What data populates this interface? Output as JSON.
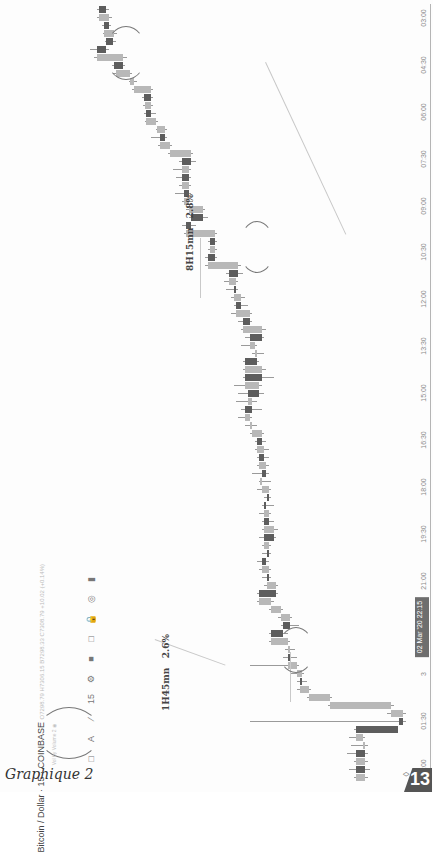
{
  "page": {
    "caption": "Graphique 2",
    "page_number": "13"
  },
  "chart_header": {
    "symbol_title": "Bitcoin / Dollar · 15 · COINBASE",
    "ohlc": "O7298.79 H7306.15 B7298.33 C7308.79 +10.02 (+0.14%)",
    "indicator": "Vol by Volume 2",
    "eye_icon": "◉"
  },
  "toolbar": {
    "items": [
      {
        "name": "rectangle-tool",
        "glyph": "□"
      },
      {
        "name": "text-tool",
        "glyph": "A"
      },
      {
        "name": "trendline-tool",
        "glyph": "∕"
      },
      {
        "name": "interval-15",
        "glyph": "15"
      },
      {
        "name": "settings-gear",
        "glyph": "⚙"
      },
      {
        "name": "fill-color",
        "glyph": "■"
      },
      {
        "name": "shape-select",
        "glyph": "□"
      },
      {
        "name": "lock",
        "glyph": "🔒"
      },
      {
        "name": "visibility",
        "glyph": "◎"
      },
      {
        "name": "more",
        "glyph": "▮"
      }
    ]
  },
  "annotations": [
    {
      "label": "8H15mn",
      "pct": "2.8%"
    },
    {
      "label": "1H45mn",
      "pct": "2.6%"
    }
  ],
  "chart_data": {
    "type": "candlestick",
    "title": "Bitcoin / Dollar · 15 · COINBASE",
    "orientation": "rotated 90° clockwise (time runs bottom→top, price increases leftward)",
    "xlabel": "Time (15-min candles)",
    "ylabel": "Price (USD)",
    "x_ticks": [
      "03:00",
      "04:30",
      "06:00",
      "07:30",
      "09:00",
      "10:30",
      "12:00",
      "13:30",
      "15:00",
      "16:30",
      "18:00",
      "19:30",
      "21:00",
      "02 Mar '20 22:15",
      "3",
      "01:30",
      "03:00"
    ],
    "highlighted_tick": "02 Mar '20 22:15",
    "annotations": [
      {
        "text": "8H15mn 2.8%",
        "from": "04:00",
        "to": "12:15"
      },
      {
        "text": "1H45mn 2.6%",
        "from": "22:45",
        "to": "01:00"
      }
    ],
    "candles": [
      {
        "x": 2,
        "o": 58,
        "c": 52,
        "h": 60,
        "l": 50
      },
      {
        "x": 10,
        "o": 52,
        "c": 60,
        "h": 63,
        "l": 50
      },
      {
        "x": 18,
        "o": 60,
        "c": 56,
        "h": 62,
        "l": 54
      },
      {
        "x": 26,
        "o": 56,
        "c": 65,
        "h": 67,
        "l": 55
      },
      {
        "x": 34,
        "o": 64,
        "c": 58,
        "h": 66,
        "l": 57
      },
      {
        "x": 42,
        "o": 58,
        "c": 50,
        "h": 60,
        "l": 44
      },
      {
        "x": 50,
        "o": 50,
        "c": 72,
        "h": 76,
        "l": 48
      },
      {
        "x": 58,
        "o": 72,
        "c": 65,
        "h": 74,
        "l": 63
      },
      {
        "x": 66,
        "o": 66,
        "c": 78,
        "h": 80,
        "l": 64
      },
      {
        "x": 74,
        "o": 78,
        "c": 82,
        "h": 84,
        "l": 77
      },
      {
        "x": 82,
        "o": 82,
        "c": 96,
        "h": 98,
        "l": 80
      },
      {
        "x": 90,
        "o": 96,
        "c": 90,
        "h": 98,
        "l": 88
      },
      {
        "x": 98,
        "o": 91,
        "c": 96,
        "h": 98,
        "l": 89
      },
      {
        "x": 106,
        "o": 96,
        "c": 92,
        "h": 100,
        "l": 90
      },
      {
        "x": 114,
        "o": 92,
        "c": 100,
        "h": 102,
        "l": 91
      },
      {
        "x": 122,
        "o": 101,
        "c": 108,
        "h": 110,
        "l": 100
      },
      {
        "x": 130,
        "o": 108,
        "c": 104,
        "h": 110,
        "l": 96
      },
      {
        "x": 138,
        "o": 104,
        "c": 112,
        "h": 114,
        "l": 102
      },
      {
        "x": 146,
        "o": 112,
        "c": 130,
        "h": 132,
        "l": 110
      },
      {
        "x": 154,
        "o": 130,
        "c": 122,
        "h": 134,
        "l": 120
      },
      {
        "x": 162,
        "o": 122,
        "c": 128,
        "h": 130,
        "l": 115
      },
      {
        "x": 170,
        "o": 128,
        "c": 122,
        "h": 130,
        "l": 117
      },
      {
        "x": 178,
        "o": 122,
        "c": 128,
        "h": 130,
        "l": 120
      },
      {
        "x": 186,
        "o": 128,
        "c": 124,
        "h": 130,
        "l": 116
      },
      {
        "x": 194,
        "o": 124,
        "c": 128,
        "h": 132,
        "l": 122
      },
      {
        "x": 202,
        "o": 128,
        "c": 140,
        "h": 142,
        "l": 126
      },
      {
        "x": 210,
        "o": 140,
        "c": 130,
        "h": 144,
        "l": 128
      },
      {
        "x": 218,
        "o": 130,
        "c": 126,
        "h": 134,
        "l": 122
      },
      {
        "x": 226,
        "o": 126,
        "c": 150,
        "h": 152,
        "l": 124
      },
      {
        "x": 234,
        "o": 150,
        "c": 146,
        "h": 152,
        "l": 144
      },
      {
        "x": 242,
        "o": 146,
        "c": 150,
        "h": 152,
        "l": 144
      },
      {
        "x": 250,
        "o": 150,
        "c": 144,
        "h": 152,
        "l": 142
      },
      {
        "x": 258,
        "o": 144,
        "c": 170,
        "h": 172,
        "l": 142
      },
      {
        "x": 266,
        "o": 170,
        "c": 162,
        "h": 174,
        "l": 160
      },
      {
        "x": 274,
        "o": 162,
        "c": 168,
        "h": 170,
        "l": 158
      },
      {
        "x": 282,
        "o": 168,
        "c": 166,
        "h": 170,
        "l": 160
      },
      {
        "x": 290,
        "o": 166,
        "c": 172,
        "h": 176,
        "l": 164
      },
      {
        "x": 298,
        "o": 172,
        "c": 168,
        "h": 178,
        "l": 166
      },
      {
        "x": 306,
        "o": 168,
        "c": 180,
        "h": 182,
        "l": 164
      },
      {
        "x": 314,
        "o": 180,
        "c": 174,
        "h": 182,
        "l": 170
      },
      {
        "x": 322,
        "o": 174,
        "c": 190,
        "h": 194,
        "l": 172
      },
      {
        "x": 330,
        "o": 190,
        "c": 180,
        "h": 192,
        "l": 176
      },
      {
        "x": 338,
        "o": 180,
        "c": 184,
        "h": 186,
        "l": 172
      },
      {
        "x": 346,
        "o": 184,
        "c": 186,
        "h": 192,
        "l": 182
      },
      {
        "x": 354,
        "o": 186,
        "c": 176,
        "h": 188,
        "l": 174
      },
      {
        "x": 362,
        "o": 176,
        "c": 190,
        "h": 194,
        "l": 174
      },
      {
        "x": 370,
        "o": 190,
        "c": 176,
        "h": 200,
        "l": 174
      },
      {
        "x": 378,
        "o": 176,
        "c": 188,
        "h": 190,
        "l": 166
      },
      {
        "x": 386,
        "o": 188,
        "c": 178,
        "h": 192,
        "l": 170
      },
      {
        "x": 394,
        "o": 178,
        "c": 182,
        "h": 186,
        "l": 168
      },
      {
        "x": 402,
        "o": 182,
        "c": 176,
        "h": 190,
        "l": 172
      },
      {
        "x": 410,
        "o": 176,
        "c": 180,
        "h": 182,
        "l": 170
      },
      {
        "x": 418,
        "o": 180,
        "c": 182,
        "h": 186,
        "l": 176
      },
      {
        "x": 426,
        "o": 182,
        "c": 190,
        "h": 192,
        "l": 180
      },
      {
        "x": 434,
        "o": 190,
        "c": 186,
        "h": 194,
        "l": 184
      },
      {
        "x": 442,
        "o": 186,
        "c": 192,
        "h": 196,
        "l": 184
      },
      {
        "x": 450,
        "o": 192,
        "c": 188,
        "h": 196,
        "l": 186
      },
      {
        "x": 458,
        "o": 188,
        "c": 194,
        "h": 196,
        "l": 186
      },
      {
        "x": 466,
        "o": 194,
        "c": 190,
        "h": 196,
        "l": 182
      },
      {
        "x": 474,
        "o": 190,
        "c": 190,
        "h": 198,
        "l": 188
      },
      {
        "x": 482,
        "o": 190,
        "c": 196,
        "h": 198,
        "l": 186
      },
      {
        "x": 490,
        "o": 196,
        "c": 194,
        "h": 198,
        "l": 192
      },
      {
        "x": 498,
        "o": 194,
        "c": 192,
        "h": 200,
        "l": 190
      },
      {
        "x": 506,
        "o": 192,
        "c": 196,
        "h": 198,
        "l": 188
      },
      {
        "x": 514,
        "o": 196,
        "c": 192,
        "h": 200,
        "l": 190
      },
      {
        "x": 522,
        "o": 192,
        "c": 200,
        "h": 204,
        "l": 190
      },
      {
        "x": 530,
        "o": 200,
        "c": 192,
        "h": 202,
        "l": 188
      },
      {
        "x": 538,
        "o": 192,
        "c": 196,
        "h": 198,
        "l": 190
      },
      {
        "x": 546,
        "o": 196,
        "c": 194,
        "h": 198,
        "l": 190
      },
      {
        "x": 554,
        "o": 194,
        "c": 190,
        "h": 196,
        "l": 186
      },
      {
        "x": 562,
        "o": 190,
        "c": 196,
        "h": 198,
        "l": 188
      },
      {
        "x": 570,
        "o": 196,
        "c": 194,
        "h": 198,
        "l": 190
      },
      {
        "x": 578,
        "o": 194,
        "c": 202,
        "h": 204,
        "l": 192
      },
      {
        "x": 586,
        "o": 202,
        "c": 188,
        "h": 204,
        "l": 186
      },
      {
        "x": 594,
        "o": 188,
        "c": 198,
        "h": 200,
        "l": 186
      },
      {
        "x": 602,
        "o": 198,
        "c": 206,
        "h": 208,
        "l": 196
      },
      {
        "x": 610,
        "o": 206,
        "c": 214,
        "h": 216,
        "l": 204
      },
      {
        "x": 618,
        "o": 214,
        "c": 208,
        "h": 222,
        "l": 206
      },
      {
        "x": 626,
        "o": 208,
        "c": 198,
        "h": 212,
        "l": 196
      },
      {
        "x": 634,
        "o": 198,
        "c": 212,
        "h": 214,
        "l": 196
      },
      {
        "x": 642,
        "o": 212,
        "c": 214,
        "h": 218,
        "l": 210
      },
      {
        "x": 650,
        "o": 214,
        "c": 212,
        "h": 220,
        "l": 208
      },
      {
        "x": 658,
        "o": 212,
        "c": 220,
        "h": 222,
        "l": 180
      },
      {
        "x": 666,
        "o": 220,
        "c": 224,
        "h": 226,
        "l": 214
      },
      {
        "x": 674,
        "o": 224,
        "c": 222,
        "h": 228,
        "l": 220
      },
      {
        "x": 682,
        "o": 222,
        "c": 230,
        "h": 232,
        "l": 220
      },
      {
        "x": 690,
        "o": 230,
        "c": 248,
        "h": 250,
        "l": 228
      },
      {
        "x": 698,
        "o": 248,
        "c": 300,
        "h": 302,
        "l": 246
      },
      {
        "x": 706,
        "o": 300,
        "c": 310,
        "h": 312,
        "l": 296
      },
      {
        "x": 714,
        "o": 310,
        "c": 306,
        "h": 312,
        "l": 180
      },
      {
        "x": 722,
        "o": 306,
        "c": 270,
        "h": 306,
        "l": 268
      },
      {
        "x": 730,
        "o": 270,
        "c": 276,
        "h": 278,
        "l": 264
      },
      {
        "x": 738,
        "o": 276,
        "c": 278,
        "h": 280,
        "l": 266
      },
      {
        "x": 746,
        "o": 278,
        "c": 270,
        "h": 280,
        "l": 262
      },
      {
        "x": 754,
        "o": 270,
        "c": 278,
        "h": 280,
        "l": 268
      },
      {
        "x": 762,
        "o": 278,
        "c": 270,
        "h": 282,
        "l": 264
      },
      {
        "x": 770,
        "o": 270,
        "c": 278,
        "h": 280,
        "l": 268
      }
    ],
    "colors": {
      "up": "#b8b8b8",
      "down": "#5d5d5d",
      "wick": "#9a9a9a"
    }
  }
}
